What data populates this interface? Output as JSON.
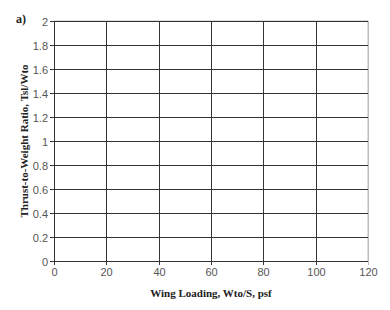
{
  "chart_data": {
    "type": "line",
    "panel_label": "a)",
    "title": "",
    "xlabel": "Wing Loading, Wto/S, psf",
    "ylabel": "Thrust-to-Weight Ratio, Tsl/Wto",
    "xlim": [
      0,
      120
    ],
    "ylim": [
      0,
      2
    ],
    "x_ticks": [
      "0",
      "20",
      "40",
      "60",
      "80",
      "100",
      "120"
    ],
    "y_ticks": [
      "0",
      "0.2",
      "0.4",
      "0.6",
      "0.8",
      "1",
      "1.2",
      "1.4",
      "1.6",
      "1.8",
      "2"
    ],
    "grid": true,
    "legend": null,
    "series": []
  },
  "colors": {
    "grid": "#333333",
    "frame": "#bbbbbb",
    "tick_text": "#555555"
  }
}
